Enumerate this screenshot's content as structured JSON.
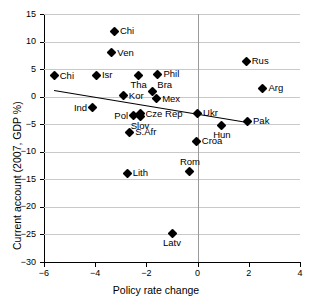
{
  "chart_data": {
    "type": "scatter",
    "title": "",
    "xlabel": "Policy rate change",
    "ylabel": "Current account (2007, GDP %)",
    "xlim": [
      -6,
      4
    ],
    "ylim": [
      -30,
      15
    ],
    "xticks": [
      -6,
      -4,
      -2,
      0,
      2,
      4
    ],
    "xtick_labels": [
      "−6",
      "−4",
      "−2",
      "0",
      "2",
      "4"
    ],
    "yticks": [
      15,
      10,
      5,
      0,
      -5,
      -10,
      -15,
      -20,
      -25,
      -30
    ],
    "ytick_labels": [
      "15",
      "10",
      "5",
      "0",
      "−5",
      "−10",
      "−15",
      "−20",
      "−25",
      "−30"
    ],
    "grid": "horizontal",
    "legend": "none",
    "marker_shape": "diamond",
    "marker_color": "#000000",
    "gridline_color": "#c9c9c9",
    "axis_color": "#000000",
    "points": [
      {
        "label": "Chi",
        "x": -3.25,
        "y": 11.9,
        "pos": "right"
      },
      {
        "label": "Ven",
        "x": -3.35,
        "y": 8.0,
        "pos": "right"
      },
      {
        "label": "Rus",
        "x": 1.9,
        "y": 6.4,
        "pos": "right"
      },
      {
        "label": "Chi",
        "x": -5.6,
        "y": 3.8,
        "pos": "right"
      },
      {
        "label": "Isr",
        "x": -3.95,
        "y": 3.9,
        "pos": "right"
      },
      {
        "label": "Tha",
        "x": -2.3,
        "y": 3.9,
        "pos": "below"
      },
      {
        "label": "Phil",
        "x": -1.55,
        "y": 4.1,
        "pos": "right"
      },
      {
        "label": "Arg",
        "x": 2.55,
        "y": 1.5,
        "pos": "right"
      },
      {
        "label": "Bra",
        "x": -1.75,
        "y": 1.0,
        "pos": "above-right"
      },
      {
        "label": "Kor",
        "x": -2.9,
        "y": 0.2,
        "pos": "right"
      },
      {
        "label": "Mex",
        "x": -1.6,
        "y": -0.4,
        "pos": "right"
      },
      {
        "label": "Ind",
        "x": -4.1,
        "y": -2.0,
        "pos": "left"
      },
      {
        "label": "Ukr",
        "x": 0.0,
        "y": -3.0,
        "pos": "right"
      },
      {
        "label": "Cze Rep",
        "x": -2.25,
        "y": -3.1,
        "pos": "right"
      },
      {
        "label": "Pol",
        "x": -2.5,
        "y": -3.5,
        "pos": "left"
      },
      {
        "label": "Slov",
        "x": -2.25,
        "y": -3.6,
        "pos": "below"
      },
      {
        "label": "Pak",
        "x": 1.95,
        "y": -4.5,
        "pos": "right"
      },
      {
        "label": "Hun",
        "x": 0.95,
        "y": -5.2,
        "pos": "below"
      },
      {
        "label": "S.Afr",
        "x": -2.65,
        "y": -6.5,
        "pos": "right"
      },
      {
        "label": "Croa",
        "x": -0.05,
        "y": -8.1,
        "pos": "right"
      },
      {
        "label": "Rom",
        "x": -0.3,
        "y": -13.5,
        "pos": "above"
      },
      {
        "label": "Lith",
        "x": -2.75,
        "y": -13.9,
        "pos": "right"
      },
      {
        "label": "Latv",
        "x": -1.0,
        "y": -24.9,
        "pos": "below"
      }
    ],
    "trendline": {
      "x0": -5.6,
      "y0": 1.3,
      "x1": 1.95,
      "y1": -4.5,
      "color": "#000000"
    }
  }
}
